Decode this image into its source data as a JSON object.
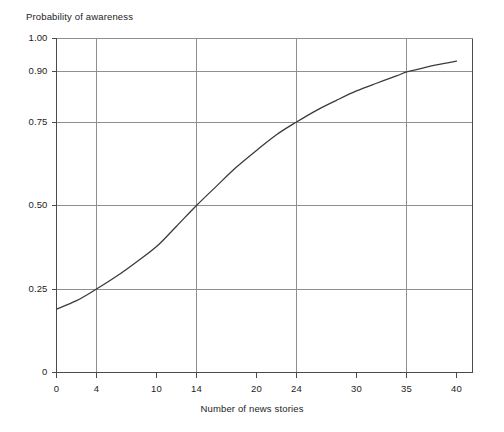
{
  "chart_data": {
    "type": "line",
    "title": "",
    "xlabel": "Number of news stories",
    "ylabel": "Probability of awareness",
    "xlim": [
      0,
      41.6
    ],
    "ylim": [
      0,
      1.0
    ],
    "grid": true,
    "legend": false,
    "x_ticks": [
      0,
      4,
      10,
      14,
      20,
      24,
      30,
      35,
      40
    ],
    "x_tick_labels": [
      "0",
      "4",
      "10",
      "14",
      "20",
      "24",
      "30",
      "35",
      "40"
    ],
    "x_gridlines": [
      4,
      14,
      24,
      35
    ],
    "y_ticks": [
      0,
      0.25,
      0.5,
      0.75,
      0.9,
      1.0
    ],
    "y_tick_labels": [
      "0",
      "0.25",
      "0.50",
      "0.75",
      "0.90",
      "1.00"
    ],
    "y_gridlines": [
      0.25,
      0.5,
      0.75,
      0.9,
      1.0
    ],
    "series": [
      {
        "name": "Probability of awareness",
        "color": "#3b3b3b",
        "x": [
          0,
          2,
          4,
          6,
          8,
          10,
          12,
          14,
          16,
          18,
          20,
          22,
          24,
          26,
          28,
          30,
          32,
          34,
          35,
          36,
          38,
          40
        ],
        "values": [
          0.19,
          0.215,
          0.25,
          0.288,
          0.331,
          0.377,
          0.438,
          0.5,
          0.558,
          0.615,
          0.665,
          0.712,
          0.75,
          0.785,
          0.815,
          0.843,
          0.866,
          0.888,
          0.9,
          0.907,
          0.921,
          0.932
        ]
      }
    ],
    "annotations": [
      {
        "label": "curve crosses 0.25 at x = 4"
      },
      {
        "label": "curve crosses 0.50 at x = 14"
      },
      {
        "label": "curve crosses 0.75 at x = 24"
      },
      {
        "label": "curve crosses 0.90 at x = 35"
      }
    ],
    "colors": {
      "curve": "#3b3b3b",
      "axis": "#4a4a4a",
      "grid": "#8f8f8f",
      "text": "#1d1d1d",
      "background": "#ffffff"
    }
  }
}
